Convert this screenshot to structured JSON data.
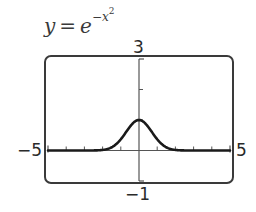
{
  "figure": {
    "title_lhs": "y",
    "title_eq": "=",
    "title_base": "e",
    "title_exp_sign": "−",
    "title_exp_var": "x",
    "title_exp_power": "2",
    "window": {
      "xmin_label": "−5",
      "xmax_label": "5",
      "ymin_label": "−1",
      "ymax_label": "3"
    },
    "colors": {
      "frame": "#3a3a3a",
      "axis": "#555555",
      "curve": "#1a1a1a",
      "background": "#ffffff"
    }
  },
  "chart_data": {
    "type": "line",
    "xlabel": "",
    "ylabel": "",
    "xlim": [
      -5,
      5
    ],
    "ylim": [
      -1,
      3
    ],
    "xscale_ticks": 1,
    "yscale_ticks": 1,
    "grid": false,
    "legend": null,
    "series": [
      {
        "name": "y = e^(−x^2)",
        "x": [
          -5,
          -4,
          -3,
          -2.5,
          -2,
          -1.5,
          -1,
          -0.5,
          0,
          0.5,
          1,
          1.5,
          2,
          2.5,
          3,
          4,
          5
        ],
        "values": [
          0.0,
          0.0,
          0.0001,
          0.0019,
          0.0183,
          0.1054,
          0.3679,
          0.7788,
          1.0,
          0.7788,
          0.3679,
          0.1054,
          0.0183,
          0.0019,
          0.0001,
          0.0,
          0.0
        ]
      }
    ],
    "annotations": [
      "3",
      "−1",
      "−5",
      "5"
    ]
  }
}
